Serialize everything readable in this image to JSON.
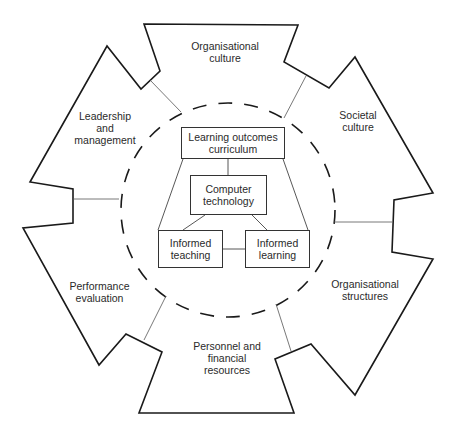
{
  "diagram": {
    "outer_sections": [
      {
        "id": "organisational-culture",
        "label": "Organisational\nculture"
      },
      {
        "id": "societal-culture",
        "label": "Societal\nculture"
      },
      {
        "id": "organisational-structures",
        "label": "Organisational\nstructures"
      },
      {
        "id": "personnel-financial",
        "label": "Personnel and\nfinancial\nresources"
      },
      {
        "id": "performance-evaluation",
        "label": "Performance\nevaluation"
      },
      {
        "id": "leadership-management",
        "label": "Leadership\nand\nmanagement"
      }
    ],
    "inner_boxes": [
      {
        "id": "learning-outcomes",
        "label": "Learning outcomes\ncurriculum"
      },
      {
        "id": "computer-technology",
        "label": "Computer\ntechnology"
      },
      {
        "id": "informed-teaching",
        "label": "Informed\nteaching"
      },
      {
        "id": "informed-learning",
        "label": "Informed\nlearning"
      }
    ],
    "colors": {
      "stroke": "#1a1a1a",
      "thin_stroke": "#555555",
      "text": "#2a2a2a"
    }
  }
}
